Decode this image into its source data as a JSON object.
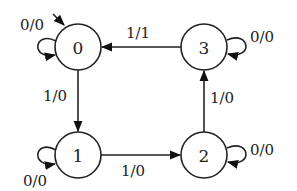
{
  "diagram": {
    "type": "finite-state-machine",
    "nodes": [
      {
        "id": "0",
        "label": "0",
        "initial": true
      },
      {
        "id": "1",
        "label": "1"
      },
      {
        "id": "2",
        "label": "2"
      },
      {
        "id": "3",
        "label": "3"
      }
    ],
    "edges": [
      {
        "from": "0",
        "to": "0",
        "label": "0/0"
      },
      {
        "from": "0",
        "to": "1",
        "label": "1/0"
      },
      {
        "from": "1",
        "to": "1",
        "label": "0/0"
      },
      {
        "from": "1",
        "to": "2",
        "label": "1/0"
      },
      {
        "from": "2",
        "to": "2",
        "label": "0/0"
      },
      {
        "from": "2",
        "to": "3",
        "label": "1/0"
      },
      {
        "from": "3",
        "to": "3",
        "label": "0/0"
      },
      {
        "from": "3",
        "to": "0",
        "label": "1/1"
      }
    ]
  },
  "colors": {
    "stroke": "#222222",
    "background": "#ffffff"
  }
}
